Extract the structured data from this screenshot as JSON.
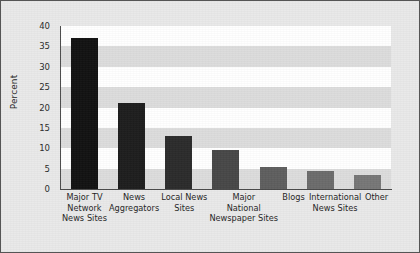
{
  "chart_data": {
    "type": "bar",
    "title": "",
    "xlabel": "",
    "ylabel": "Percent",
    "ylim": [
      0,
      40
    ],
    "yticks": [
      0,
      5,
      10,
      15,
      20,
      25,
      30,
      35,
      40
    ],
    "grid": "alternating horizontal bands every 5 units",
    "legend": "none",
    "categories": [
      "Major TV Network News Sites",
      "News Aggregators",
      "Local News Sites",
      "Major National Newspaper Sites",
      "Blogs",
      "International News Sites",
      "Other"
    ],
    "category_lines": [
      [
        "Major TV",
        "Network",
        "News Sites"
      ],
      [
        "News",
        "Aggregators"
      ],
      [
        "Local News",
        "Sites"
      ],
      [
        "Major",
        "National",
        "Newspaper Sites"
      ],
      [
        "Blogs"
      ],
      [
        "International",
        "News Sites"
      ],
      [
        "Other"
      ]
    ],
    "values": [
      37,
      21,
      13,
      9.5,
      5.5,
      4.5,
      3.5
    ],
    "bar_colors": [
      "#111111",
      "#1d1d1d",
      "#2b2b2b",
      "#474747",
      "#5e5e5e",
      "#6b6b6b",
      "#767676"
    ]
  },
  "style": {
    "figure_background": "#e9e9e9",
    "plot_background": "#ffffff",
    "band_color": "#dcdcdc",
    "axis_color": "#4a4a4a",
    "border_color": "#555555",
    "text_color": "#1f1f1f"
  }
}
